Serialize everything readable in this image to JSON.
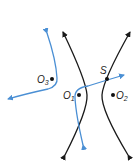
{
  "diagram": {
    "type": "hyperbola-reflection",
    "colors": {
      "hyperbola": "#1a1a1a",
      "ray": "#4a8fd4",
      "points": "#111111"
    },
    "points": {
      "O1": {
        "label": "O",
        "sub": "1"
      },
      "O2": {
        "label": "O",
        "sub": "2"
      },
      "O3": {
        "label": "O",
        "sub": "3"
      },
      "S": {
        "label": "S"
      }
    }
  }
}
